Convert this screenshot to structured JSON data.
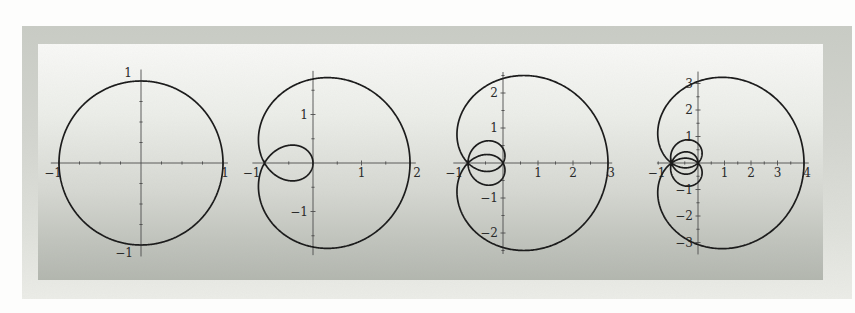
{
  "figure": {
    "colors": {
      "page_bg": "#fdfdfc",
      "panel_top": "#c9ccc5",
      "panel_bottom": "#ecede8",
      "inner_top": "#f9f9f7",
      "inner_bottom": "#b2b6ae",
      "curve": "#1c1c1c",
      "axis": "#4d4d4d",
      "label": "#2a2a2a"
    },
    "curve_stroke_px": 1.7,
    "axis_stroke_px": 0.9,
    "tick_font_px": 12
  },
  "chart_data": [
    {
      "type": "line",
      "name": "plot-n1-circle",
      "title": "",
      "curve": "unit circle: x = cos t, y = sin t (z on |z|=1)",
      "parametric": {
        "n_terms": 1,
        "x": "sum_{k=1}^{n} cos(k t)",
        "y": "sum_{k=1}^{n} sin(k t)",
        "t_range": [
          0,
          6.28319
        ]
      },
      "origin_px": [
        141,
        163
      ],
      "px_per_unit": 82,
      "xlim": [
        -1.1,
        1.06
      ],
      "ylim": [
        -1.14,
        1.14
      ],
      "tick_step": 0.25,
      "x_ticks": [
        {
          "v": -1,
          "label": "−1",
          "dx": -6
        },
        {
          "v": 1,
          "label": "1",
          "dx": 2
        }
      ],
      "y_ticks": [
        {
          "v": 1,
          "label": "1",
          "dx": -4,
          "dy": -8
        },
        {
          "v": -1,
          "label": "−1",
          "dx": -3,
          "dy": 8
        }
      ]
    },
    {
      "type": "line",
      "name": "plot-n2-limacon",
      "title": "",
      "curve": "x = cos t + cos 2t, y = sin t + sin 2t (z + z^2 on |z|=1); node at (−1,0), max x = 2",
      "parametric": {
        "n_terms": 2,
        "x": "sum_{k=1}^{n} cos(k t)",
        "y": "sum_{k=1}^{n} sin(k t)",
        "t_range": [
          0,
          6.28319
        ]
      },
      "origin_px": [
        313,
        163
      ],
      "px_per_unit": 48.5,
      "xlim": [
        -1.25,
        2.12
      ],
      "ylim": [
        -1.9,
        1.9
      ],
      "tick_step": 0.5,
      "x_ticks": [
        {
          "v": -1,
          "label": "−1",
          "dx": -13
        },
        {
          "v": 1,
          "label": "1"
        },
        {
          "v": 2,
          "label": "2",
          "dx": 7
        }
      ],
      "y_ticks": [
        {
          "v": 1,
          "label": "1"
        },
        {
          "v": -1,
          "label": "−1"
        }
      ]
    },
    {
      "type": "line",
      "name": "plot-n3-three-loops",
      "title": "",
      "curve": "x = cos t + cos 2t + cos 3t, y = sin t + sin 2t + sin 3t (z + z^2 + z^3 on |z|=1); triple point at (−1,0), max x = 3",
      "parametric": {
        "n_terms": 3,
        "x": "sum_{k=1}^{n} cos(k t)",
        "y": "sum_{k=1}^{n} sin(k t)",
        "t_range": [
          0,
          6.28319
        ]
      },
      "origin_px": [
        503,
        163
      ],
      "px_per_unit": 35,
      "xlim": [
        -1.42,
        3.12
      ],
      "ylim": [
        -2.6,
        2.6
      ],
      "tick_step": 0.5,
      "x_ticks": [
        {
          "v": -1,
          "label": "−1",
          "dx": -14
        },
        {
          "v": 1,
          "label": "1"
        },
        {
          "v": 2,
          "label": "2"
        },
        {
          "v": 3,
          "label": "3",
          "dx": 3
        }
      ],
      "y_ticks": [
        {
          "v": 2,
          "label": "2"
        },
        {
          "v": 1,
          "label": "1"
        },
        {
          "v": -1,
          "label": "−1"
        },
        {
          "v": -2,
          "label": "−2"
        }
      ]
    },
    {
      "type": "line",
      "name": "plot-n4-four-loops",
      "title": "",
      "curve": "x = cos t + cos 2t + cos 3t + cos 4t, y = sin t + sin 2t + sin 3t + sin 4t (z + z^2 + z^3 + z^4 on |z|=1); quadruple point at (−1,0), max x = 4",
      "parametric": {
        "n_terms": 4,
        "x": "sum_{k=1}^{n} cos(k t)",
        "y": "sum_{k=1}^{n} sin(k t)",
        "t_range": [
          0,
          6.28319
        ]
      },
      "origin_px": [
        698,
        163
      ],
      "px_per_unit": 26.5,
      "xlim": [
        -1.55,
        4.18
      ],
      "ylim": [
        -3.45,
        3.45
      ],
      "tick_step": 0.5,
      "x_ticks": [
        {
          "v": -1,
          "label": "−1",
          "dx": -15
        },
        {
          "v": 1,
          "label": "1"
        },
        {
          "v": 2,
          "label": "2"
        },
        {
          "v": 3,
          "label": "3"
        },
        {
          "v": 4,
          "label": "4",
          "dx": 3
        }
      ],
      "y_ticks": [
        {
          "v": 3,
          "label": "3"
        },
        {
          "v": 2,
          "label": "2"
        },
        {
          "v": 1,
          "label": "1"
        },
        {
          "v": -1,
          "label": "−1"
        },
        {
          "v": -2,
          "label": "−2"
        },
        {
          "v": -3,
          "label": "−3"
        }
      ]
    }
  ]
}
